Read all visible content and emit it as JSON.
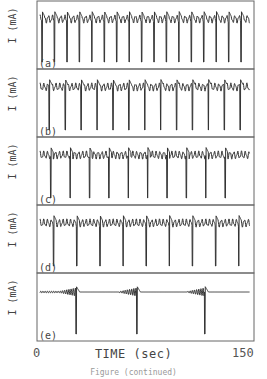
{
  "chart_data": {
    "type": "line",
    "title": "",
    "xlabel": "TIME (sec)",
    "ylabel": "I (mA)",
    "xlim": [
      0,
      150
    ],
    "x_ticks": [
      "0",
      "150"
    ],
    "grid": false,
    "legend": null,
    "caption": "Figure (continued)",
    "panels": [
      {
        "label": "(a)",
        "ylabel": "I (mA)",
        "spike_count": 17,
        "period_sec": 8.6,
        "first_spike_sec": 3.5,
        "small_oscillations_per_cycle": 2,
        "description": "dense periodic spikes with mixed-mode small oscillations"
      },
      {
        "label": "(b)",
        "ylabel": "I (mA)",
        "spike_count": 13,
        "period_sec": 11.0,
        "first_spike_sec": 8.5,
        "small_oscillations_per_cycle": 3,
        "description": "periodic large spikes separated by ~3 small oscillations"
      },
      {
        "label": "(c)",
        "ylabel": "I (mA)",
        "spike_count": 10,
        "period_sec": 13.4,
        "first_spike_sec": 9.5,
        "small_oscillations_per_cycle": 4,
        "description": "periodic large spikes separated by ~4 small oscillations"
      },
      {
        "label": "(d)",
        "ylabel": "I (mA)",
        "spike_count": 9,
        "period_sec": 16.0,
        "first_spike_sec": 11.5,
        "small_oscillations_per_cycle": 5,
        "description": "periodic large spikes separated by ~5 small oscillations"
      },
      {
        "label": "(e)",
        "ylabel": "I (mA)",
        "spike_count": 3,
        "spike_times_sec": [
          27,
          69,
          116
        ],
        "description": "long quiescent intervals with growing oscillation before each spike"
      }
    ]
  },
  "axis": {
    "x_tick_start": "0",
    "x_tick_end": "150",
    "xlabel": "TIME (sec)",
    "ylabel": "I (mA)"
  },
  "caption": "Figure (continued)"
}
